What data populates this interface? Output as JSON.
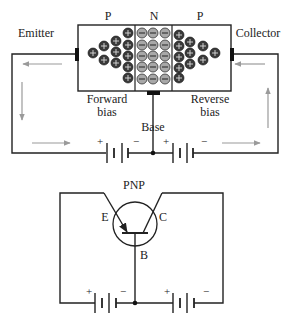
{
  "top_diagram": {
    "regions": [
      {
        "label": "P",
        "type": "p-type",
        "carrier": "+"
      },
      {
        "label": "N",
        "type": "n-type",
        "carrier": "-"
      },
      {
        "label": "P",
        "type": "p-type",
        "carrier": "+"
      }
    ],
    "terminal_labels": {
      "emitter": "Emitter",
      "collector": "Collector",
      "base": "Base"
    },
    "junction_labels": {
      "left_line1": "Forward",
      "left_line2": "bias",
      "right_line1": "Reverse",
      "right_line2": "bias"
    },
    "battery_signs": {
      "plus": "+",
      "minus": "−"
    },
    "colors": {
      "hole": "#3a3a3a",
      "electron": "#a8a8a8",
      "current_arrow": "#9a9a9a",
      "wire": "#222222"
    }
  },
  "bottom_diagram": {
    "title": "PNP",
    "emitter_label": "E",
    "collector_label": "C",
    "base_label": "B",
    "battery_signs": {
      "plus": "+",
      "minus": "−"
    }
  }
}
